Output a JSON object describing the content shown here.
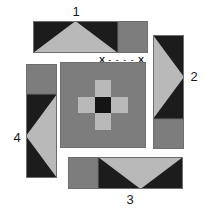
{
  "diagram": {
    "colors": {
      "dark": "#1c1c1c",
      "medium": "#7d7d7d",
      "light": "#b9b9b9",
      "background": "#ffffff",
      "outline": "#4a4a4a",
      "text": "#1a1a1a"
    },
    "labels": [
      {
        "id": "label-1",
        "text": "1"
      },
      {
        "id": "label-2",
        "text": "2"
      },
      {
        "id": "label-3",
        "text": "3"
      },
      {
        "id": "label-4",
        "text": "4"
      }
    ],
    "seam_marker": {
      "left_end": "X",
      "dashes": "- - - -",
      "right_end": "X"
    },
    "center_block": {
      "rows": 5,
      "columns": 5,
      "cells": [
        [
          "medium",
          "medium",
          "medium",
          "medium",
          "medium"
        ],
        [
          "medium",
          "medium",
          "light",
          "medium",
          "medium"
        ],
        [
          "medium",
          "light",
          "dark",
          "light",
          "medium"
        ],
        [
          "medium",
          "medium",
          "light",
          "medium",
          "medium"
        ],
        [
          "medium",
          "medium",
          "medium",
          "medium",
          "medium"
        ]
      ]
    },
    "strips": [
      {
        "id": "strip-top",
        "label": "1",
        "orientation": "horizontal",
        "segments": [
          "triangle-peak-light-on-dark",
          "medium-square"
        ]
      },
      {
        "id": "strip-right",
        "label": "2",
        "orientation": "vertical",
        "segments": [
          "triangle-point-light-on-dark",
          "medium-square"
        ]
      },
      {
        "id": "strip-bottom",
        "label": "3",
        "orientation": "horizontal",
        "segments": [
          "medium-square",
          "triangle-valley-light-on-dark"
        ]
      },
      {
        "id": "strip-left",
        "label": "4",
        "orientation": "vertical",
        "segments": [
          "medium-square",
          "triangle-point-light-on-dark"
        ]
      }
    ]
  }
}
